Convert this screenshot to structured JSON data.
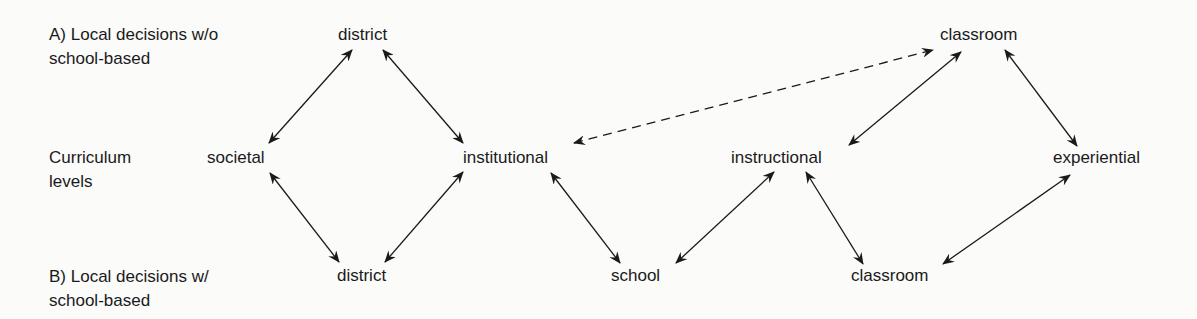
{
  "row_labels": {
    "top": {
      "line1": "A) Local decisions w/o",
      "line2": "school-based"
    },
    "middle": {
      "line1": "Curriculum",
      "line2": "levels"
    },
    "bottom": {
      "line1": "B) Local decisions w/",
      "line2": "school-based"
    }
  },
  "nodes": {
    "district_top": "district",
    "classroom_top": "classroom",
    "societal": "societal",
    "institutional": "institutional",
    "instructional": "instructional",
    "experiential": "experiential",
    "district_bottom": "district",
    "school": "school",
    "classroom_bottom": "classroom"
  },
  "edges": [
    {
      "from": "district_top",
      "to": "societal",
      "style": "solid",
      "direction": "both"
    },
    {
      "from": "district_top",
      "to": "institutional",
      "style": "solid",
      "direction": "both"
    },
    {
      "from": "institutional",
      "to": "classroom_top",
      "style": "dashed",
      "direction": "both"
    },
    {
      "from": "classroom_top",
      "to": "instructional",
      "style": "solid",
      "direction": "both"
    },
    {
      "from": "classroom_top",
      "to": "experiential",
      "style": "solid",
      "direction": "both"
    },
    {
      "from": "societal",
      "to": "district_bottom",
      "style": "solid",
      "direction": "both"
    },
    {
      "from": "institutional",
      "to": "district_bottom",
      "style": "solid",
      "direction": "both"
    },
    {
      "from": "institutional",
      "to": "school",
      "style": "solid",
      "direction": "both"
    },
    {
      "from": "instructional",
      "to": "school",
      "style": "solid",
      "direction": "both"
    },
    {
      "from": "instructional",
      "to": "classroom_bottom",
      "style": "solid",
      "direction": "both"
    },
    {
      "from": "experiential",
      "to": "classroom_bottom",
      "style": "solid",
      "direction": "both"
    }
  ],
  "colors": {
    "background": "#fbfbfa",
    "ink": "#1a1a1a"
  }
}
